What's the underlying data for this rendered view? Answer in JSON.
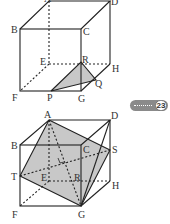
{
  "figures": [
    {
      "id": "cube-1",
      "vertices": {
        "A": "A",
        "B": "B",
        "C": "C",
        "D": "D",
        "E": "E",
        "F": "F",
        "G": "G",
        "H": "H"
      },
      "points": {
        "P": "P",
        "Q": "Q",
        "R": "R"
      },
      "shaded": "triangle PQR"
    },
    {
      "id": "cube-2",
      "vertices": {
        "A": "A",
        "B": "B",
        "C": "C",
        "D": "D",
        "E": "E",
        "F": "F",
        "G": "G",
        "H": "H"
      },
      "points": {
        "R": "R",
        "S": "S",
        "T": "T"
      },
      "shaded": "quadrilateral ATGS"
    }
  ],
  "badge": {
    "label": "23"
  },
  "colors": {
    "line": "#222222",
    "shade": "#c8c8c8"
  }
}
